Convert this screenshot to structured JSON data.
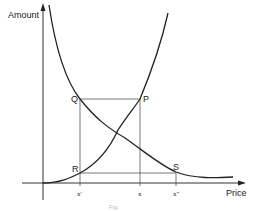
{
  "diagram": {
    "axes": {
      "y_label": "Amount",
      "x_label": "Price"
    },
    "points": {
      "Q": "Q",
      "P": "P",
      "R": "R",
      "S": "S"
    },
    "ticks": {
      "x_prime": "x'",
      "x": "x",
      "x_double_prime": "x\""
    },
    "curves": [
      {
        "name": "decreasing-curve",
        "description": "downward-sloping curve from top-left to bottom-right, passing through Q and S"
      },
      {
        "name": "increasing-curve",
        "description": "upward-sloping curve from origin to top-right, passing through R and P"
      }
    ],
    "rectangle": {
      "corners": [
        "Q",
        "P",
        "R",
        "S"
      ],
      "description": "horizontal lines Q–P and R–S; vertical lines at x' (Q–R–x') and at x (P–x), vertical at x\" from S"
    },
    "caption": "Fig."
  },
  "colors": {
    "line": "#222222",
    "background": "#ffffff"
  }
}
